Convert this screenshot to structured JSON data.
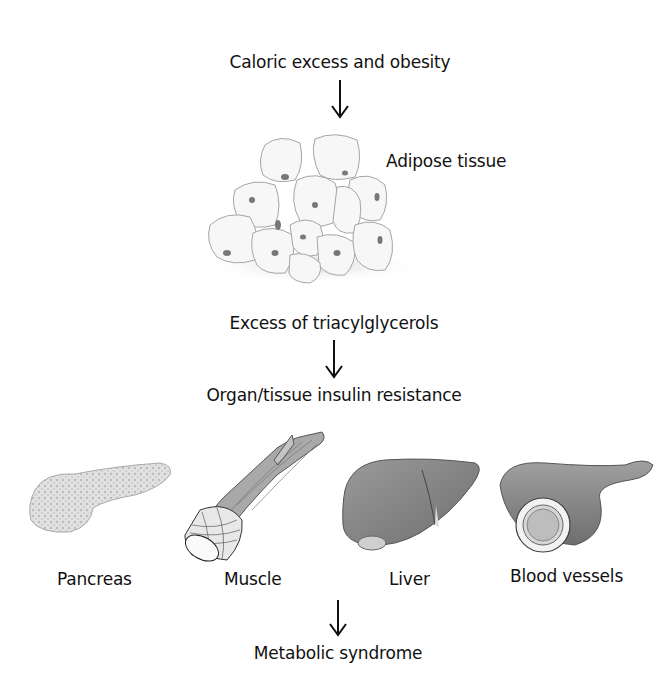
{
  "diagram": {
    "steps": [
      {
        "id": "caloric",
        "label": "Caloric excess and obesity"
      },
      {
        "id": "adipose",
        "label": "Adipose tissue"
      },
      {
        "id": "triacyl",
        "label": "Excess of triacylglycerols"
      },
      {
        "id": "insulin",
        "label": "Organ/tissue insulin resistance"
      },
      {
        "id": "metabolic",
        "label": "Metabolic syndrome"
      }
    ],
    "organs": [
      {
        "id": "pancreas",
        "label": "Pancreas",
        "icon": "pancreas-illustration"
      },
      {
        "id": "muscle",
        "label": "Muscle",
        "icon": "muscle-illustration"
      },
      {
        "id": "liver",
        "label": "Liver",
        "icon": "liver-illustration"
      },
      {
        "id": "vessels",
        "label": "Blood vessels",
        "icon": "blood-vessel-illustration"
      }
    ],
    "arrows": [
      "caloric->adipose",
      "triacyl->insulin",
      "organs->metabolic"
    ],
    "colors": {
      "text": "#111111",
      "cell_fill": "#f6f6f6",
      "cell_stroke": "#9a9a9a",
      "organ_fill": "#8c8c8c",
      "pancreas_fill": "#d8d8d8"
    }
  }
}
